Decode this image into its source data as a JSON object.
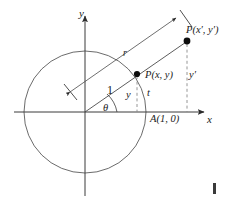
{
  "figure": {
    "axes": {
      "x_label": "x",
      "y_label": "y",
      "origin_x": 85,
      "origin_y": 112
    },
    "circle": {
      "center_x": 85,
      "center_y": 112,
      "radius": 61,
      "stroke": "#555555"
    },
    "labels": {
      "point_unit": "P(x, y)",
      "point_scaled": "P(x′, y′)",
      "point_a": "A(1, 0)",
      "radius_unit": "1",
      "radius_scaled": "r",
      "angle": "θ",
      "height_unit": "y",
      "arc_param": "t",
      "height_scaled": "y′"
    },
    "points": {
      "p_unit_x": 137,
      "p_unit_y": 74,
      "p_scaled_x": 187,
      "p_scaled_y": 41
    },
    "colors": {
      "line": "#555555",
      "ink": "#1a1a1a",
      "dash": "#777777",
      "marker": "#000000"
    }
  }
}
